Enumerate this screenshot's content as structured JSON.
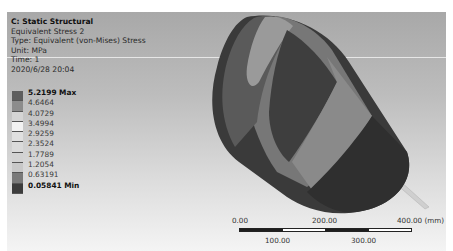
{
  "info": {
    "title": "C: Static Structural",
    "result_name": "Equivalent Stress 2",
    "type": "Type: Equivalent (von-Mises) Stress",
    "unit": "Unit: MPa",
    "time": "Time: 1",
    "date": "2020/6/28 20:04"
  },
  "legend": {
    "labels": [
      "5.2199 Max",
      "4.6464",
      "4.0729",
      "3.4994",
      "2.9259",
      "2.3524",
      "1.7789",
      "1.2054",
      "0.63191",
      "0.05841 Min"
    ],
    "colors": [
      "#5e5e5e",
      "#8c8c8c",
      "#d4d4d4",
      "#f2f2f2",
      "#e0e0e0",
      "#dadada",
      "#d2d2d2",
      "#c8c8c8",
      "#7a7a7a",
      "#3c3c3c"
    ]
  },
  "scale_bar": {
    "top_labels": [
      "0.00",
      "200.00",
      "400.00 (mm)"
    ],
    "bottom_labels": [
      "100.00",
      "300.00"
    ]
  }
}
